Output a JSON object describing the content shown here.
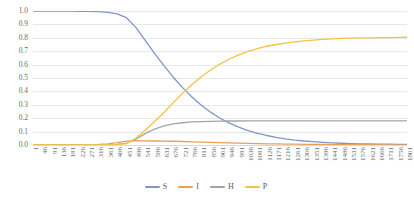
{
  "chart_data": {
    "type": "line",
    "title": "",
    "subtitle": "",
    "xlabel": "",
    "ylabel": "",
    "xlim": [
      1,
      1801
    ],
    "ylim": [
      0.0,
      1.0
    ],
    "grid": true,
    "legend_position": "bottom",
    "y_ticks": [
      "1.0",
      "0.9",
      "0.8",
      "0.7",
      "0.6",
      "0.5",
      "0.4",
      "0.3",
      "0.2",
      "0.1",
      "0.0"
    ],
    "y_tick_values": [
      1.0,
      0.9,
      0.8,
      0.7,
      0.6,
      0.5,
      0.4,
      0.3,
      0.2,
      0.1,
      0.0
    ],
    "x_tick_labels": [
      "1",
      "46",
      "91",
      "136",
      "181",
      "226",
      "271",
      "316",
      "361",
      "406",
      "451",
      "496",
      "541",
      "586",
      "631",
      "676",
      "721",
      "766",
      "811",
      "856",
      "901",
      "946",
      "991",
      "1036",
      "1081",
      "1126",
      "1171",
      "1216",
      "1261",
      "1306",
      "1351",
      "1396",
      "1441",
      "1486",
      "1531",
      "1576",
      "1621",
      "1666",
      "1711",
      "1756",
      "1801"
    ],
    "x_tick_step": 45,
    "colors": {
      "S": "#8196c8",
      "I": "#e8a05a",
      "H": "#a5a5a5",
      "P": "#f5c342"
    },
    "series": [
      {
        "name": "S",
        "color": "#8196c8",
        "x": [
          1,
          46,
          91,
          136,
          181,
          226,
          271,
          316,
          361,
          406,
          451,
          496,
          541,
          586,
          631,
          676,
          721,
          766,
          811,
          856,
          901,
          946,
          991,
          1036,
          1081,
          1126,
          1171,
          1216,
          1261,
          1306,
          1351,
          1396,
          1441,
          1486,
          1531,
          1576,
          1621,
          1666,
          1711,
          1756,
          1801
        ],
        "values": [
          1.0,
          1.0,
          1.0,
          0.999,
          0.999,
          0.998,
          0.997,
          0.995,
          0.99,
          0.978,
          0.95,
          0.878,
          0.78,
          0.684,
          0.592,
          0.506,
          0.428,
          0.358,
          0.297,
          0.245,
          0.2,
          0.163,
          0.133,
          0.108,
          0.087,
          0.071,
          0.057,
          0.046,
          0.037,
          0.03,
          0.025,
          0.02,
          0.016,
          0.013,
          0.011,
          0.009,
          0.008,
          0.007,
          0.006,
          0.005,
          0.005
        ]
      },
      {
        "name": "I",
        "color": "#e8a05a",
        "x": [
          1,
          46,
          91,
          136,
          181,
          226,
          271,
          316,
          361,
          406,
          451,
          496,
          541,
          586,
          631,
          676,
          721,
          766,
          811,
          856,
          901,
          946,
          991,
          1036,
          1081,
          1126,
          1171,
          1216,
          1261,
          1306,
          1351,
          1396,
          1441,
          1486,
          1531,
          1576,
          1621,
          1666,
          1711,
          1756,
          1801
        ],
        "values": [
          0.0,
          0.0,
          0.0,
          0.001,
          0.001,
          0.002,
          0.003,
          0.005,
          0.009,
          0.017,
          0.029,
          0.032,
          0.031,
          0.03,
          0.029,
          0.028,
          0.026,
          0.024,
          0.022,
          0.02,
          0.018,
          0.016,
          0.014,
          0.012,
          0.011,
          0.009,
          0.008,
          0.007,
          0.006,
          0.005,
          0.004,
          0.004,
          0.003,
          0.003,
          0.002,
          0.002,
          0.002,
          0.001,
          0.001,
          0.001,
          0.001
        ]
      },
      {
        "name": "H",
        "color": "#a5a5a5",
        "x": [
          1,
          46,
          91,
          136,
          181,
          226,
          271,
          316,
          361,
          406,
          451,
          496,
          541,
          586,
          631,
          676,
          721,
          766,
          811,
          856,
          901,
          946,
          991,
          1036,
          1081,
          1126,
          1171,
          1216,
          1261,
          1306,
          1351,
          1396,
          1441,
          1486,
          1531,
          1576,
          1621,
          1666,
          1711,
          1756,
          1801
        ],
        "values": [
          0.0,
          0.0,
          0.0,
          0.0,
          0.0,
          0.0,
          0.001,
          0.001,
          0.002,
          0.005,
          0.014,
          0.043,
          0.085,
          0.118,
          0.142,
          0.157,
          0.166,
          0.172,
          0.175,
          0.177,
          0.178,
          0.179,
          0.179,
          0.18,
          0.18,
          0.18,
          0.18,
          0.18,
          0.18,
          0.18,
          0.18,
          0.18,
          0.18,
          0.18,
          0.18,
          0.18,
          0.18,
          0.18,
          0.18,
          0.18,
          0.18
        ]
      },
      {
        "name": "P",
        "color": "#f5c342",
        "x": [
          1,
          46,
          91,
          136,
          181,
          226,
          271,
          316,
          361,
          406,
          451,
          496,
          541,
          586,
          631,
          676,
          721,
          766,
          811,
          856,
          901,
          946,
          991,
          1036,
          1081,
          1126,
          1171,
          1216,
          1261,
          1306,
          1351,
          1396,
          1441,
          1486,
          1531,
          1576,
          1621,
          1666,
          1711,
          1756,
          1801
        ],
        "values": [
          0.0,
          0.0,
          0.0,
          0.0,
          0.0,
          0.0,
          0.0,
          0.001,
          0.002,
          0.004,
          0.01,
          0.05,
          0.11,
          0.175,
          0.243,
          0.316,
          0.386,
          0.452,
          0.51,
          0.56,
          0.604,
          0.642,
          0.673,
          0.699,
          0.72,
          0.737,
          0.75,
          0.761,
          0.77,
          0.777,
          0.783,
          0.788,
          0.792,
          0.795,
          0.797,
          0.799,
          0.8,
          0.801,
          0.802,
          0.803,
          0.804
        ]
      }
    ],
    "legend": [
      {
        "label": "S",
        "color": "#8196c8"
      },
      {
        "label": "I",
        "color": "#e8a05a"
      },
      {
        "label": "H",
        "color": "#a5a5a5"
      },
      {
        "label": "P",
        "color": "#f5c342"
      }
    ]
  }
}
